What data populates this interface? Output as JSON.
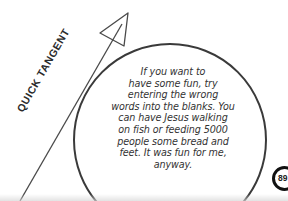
{
  "tangent": {
    "label": "QUICK TANGENT",
    "icon": "arrow-up-right-icon"
  },
  "bubble": {
    "lines": [
      "If you want to",
      "have some fun, try",
      "entering the wrong",
      "words into the blanks. You",
      "can have Jesus walking",
      "on fish or feeding 5000",
      "people some bread and",
      "feet. It was fun for me,",
      "anyway."
    ]
  },
  "page": {
    "number": "89"
  },
  "colors": {
    "ink": "#333333",
    "background": "#ffffff",
    "badge": "#111111"
  }
}
